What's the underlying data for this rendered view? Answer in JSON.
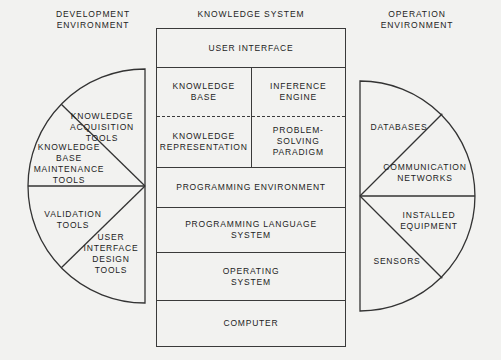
{
  "headers": {
    "development": "DEVELOPMENT\nENVIRONMENT",
    "knowledge": "KNOWLEDGE SYSTEM",
    "operation": "OPERATION\nENVIRONMENT"
  },
  "center_stack": {
    "rows": [
      {
        "cells": [
          "USER INTERFACE"
        ]
      },
      {
        "cells": [
          "KNOWLEDGE\nBASE",
          "INFERENCE\nENGINE"
        ]
      },
      {
        "cells": [
          "KNOWLEDGE\nREPRESENTATION",
          "PROBLEM-\nSOLVING\nPARADIGM"
        ]
      },
      {
        "cells": [
          "PROGRAMMING ENVIRONMENT"
        ]
      },
      {
        "cells": [
          "PROGRAMMING LANGUAGE\nSYSTEM"
        ]
      },
      {
        "cells": [
          "OPERATING\nSYSTEM"
        ]
      },
      {
        "cells": [
          "COMPUTER"
        ]
      }
    ]
  },
  "development_wheel": {
    "sectors": [
      {
        "label_lines": [
          "KNOWLEDGE",
          "ACQUISITION",
          "TOOLS"
        ]
      },
      {
        "label_lines": [
          "KNOWLEDGE",
          "BASE",
          "MAINTENANCE",
          "TOOLS"
        ]
      },
      {
        "label_lines": [
          "VALIDATION",
          "TOOLS"
        ]
      },
      {
        "label_lines": [
          "USER",
          "INTERFACE",
          "DESIGN",
          "TOOLS"
        ]
      }
    ]
  },
  "operation_wheel": {
    "sectors": [
      {
        "label_lines": [
          "DATABASES"
        ]
      },
      {
        "label_lines": [
          "COMMUNICATION",
          "NETWORKS"
        ]
      },
      {
        "label_lines": [
          "INSTALLED",
          "EQUIPMENT"
        ]
      },
      {
        "label_lines": [
          "SENSORS"
        ]
      }
    ]
  },
  "colors": {
    "background": "#f2f2f0",
    "stroke": "#333333",
    "text": "#1c1c1c"
  }
}
